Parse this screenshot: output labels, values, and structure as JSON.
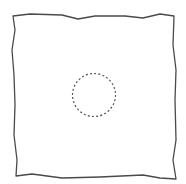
{
  "diagram": {
    "width": 186,
    "height": 184,
    "background": "#ffffff",
    "shapes": [
      {
        "id": "wavy-square",
        "type": "polygon",
        "style": "hand-drawn wavy outline",
        "stroke": "#4a4a4a",
        "stroke_width": 1.3,
        "fill": "none",
        "points": "13,16 30,14 62,15 78,19 95,16 125,16 143,18 160,14 174,16 173,45 176,70 175,100 176,140 173,160 176,179 160,178 143,175 100,177 62,178 32,174 16,176 17,160 14,135 15,105 14,75 12,50 15,30"
      },
      {
        "id": "dashed-circle",
        "type": "circle",
        "style": "dashed",
        "cx": 94,
        "cy": 95,
        "r": 21.5,
        "stroke": "#555555",
        "stroke_width": 1.2,
        "dasharray": "2 2.2",
        "fill": "none"
      }
    ]
  }
}
